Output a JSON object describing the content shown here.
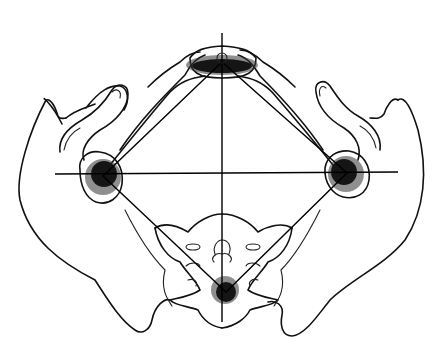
{
  "figure": {
    "colors": {
      "line": "#111111",
      "background": "#ffffff",
      "marker": "#151515"
    },
    "points": {
      "top": {
        "x": 222,
        "y": 65
      },
      "left": {
        "x": 103,
        "y": 176
      },
      "right": {
        "x": 347,
        "y": 173
      },
      "bottom": {
        "x": 226,
        "y": 292
      }
    },
    "axes": {
      "vertical": {
        "x": 222,
        "y1": 33,
        "y2": 322
      },
      "horizontal": {
        "y": 174,
        "x1": 55,
        "x2": 398
      }
    }
  }
}
